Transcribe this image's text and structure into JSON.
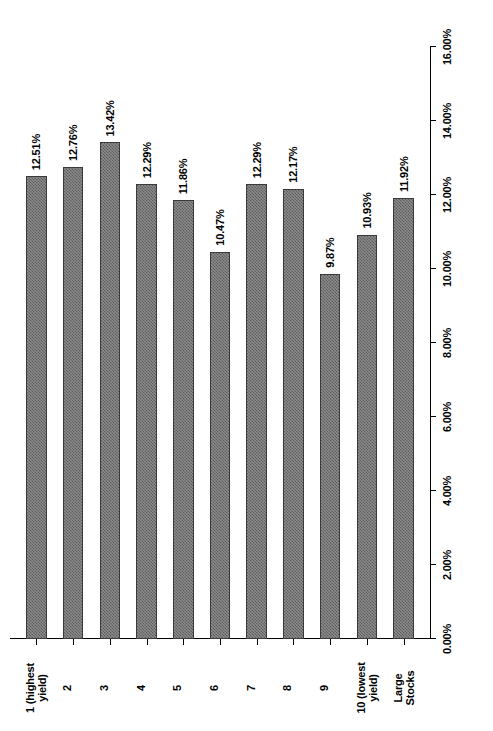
{
  "chart_data": {
    "type": "bar",
    "orientation": "horizontal",
    "title": "",
    "xlabel": "",
    "ylabel": "",
    "categories": [
      "1 (highest\nyield)",
      "2",
      "3",
      "4",
      "5",
      "6",
      "7",
      "8",
      "9",
      "10 (lowest\nyield)",
      "Large\nStocks"
    ],
    "values": [
      12.51,
      12.76,
      13.42,
      12.29,
      11.86,
      10.47,
      12.29,
      12.17,
      9.87,
      10.93,
      11.92
    ],
    "value_labels": [
      "12.51%",
      "12.76%",
      "13.42%",
      "12.29%",
      "11.86%",
      "10.47%",
      "12.29%",
      "12.17%",
      "9.87%",
      "10.93%",
      "11.92%"
    ],
    "xlim": [
      0,
      16
    ],
    "tick_values": [
      0,
      2,
      4,
      6,
      8,
      10,
      12,
      14,
      16
    ],
    "tick_labels": [
      "0.00%",
      "2.00%",
      "4.00%",
      "6.00%",
      "8.00%",
      "10.00%",
      "12.00%",
      "14.00%",
      "16.00%"
    ],
    "grid": false,
    "legend": false,
    "bar_fill_color": "#8c8c8c",
    "bar_pattern_color": "#5c5c5c",
    "bar_border_color": "#3a3a3a",
    "axis_color": "#000000",
    "background_color": "#ffffff"
  }
}
